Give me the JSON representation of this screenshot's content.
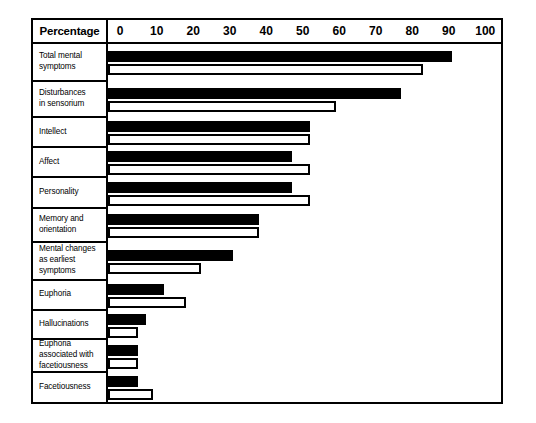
{
  "chart_data": {
    "type": "bar",
    "title": "",
    "xlabel": "Percentage",
    "ylabel": "",
    "xlim": [
      0,
      100
    ],
    "xticks": [
      0,
      10,
      20,
      30,
      40,
      50,
      60,
      70,
      80,
      90,
      100
    ],
    "grid": false,
    "orientation": "horizontal",
    "legend_position": "none",
    "categories": [
      "Total mental symptoms",
      "Disturbances in sensorium",
      "Intellect",
      "Affect",
      "Personality",
      "Memory and orientation",
      "Mental changes as earliest symptoms",
      "Euphoria",
      "Hallucinations",
      "Euphoria associated with facetiousness",
      "Facetiousness"
    ],
    "series": [
      {
        "name": "solid",
        "style": "filled-black",
        "values": [
          91,
          77,
          52,
          47,
          47,
          38,
          31,
          12,
          7,
          5,
          5
        ]
      },
      {
        "name": "open",
        "style": "outline-white",
        "values": [
          83,
          59,
          52,
          52,
          52,
          38,
          22,
          18,
          5,
          5,
          9
        ]
      }
    ]
  },
  "header": {
    "title": "Percentage",
    "ticks": [
      "0",
      "10",
      "20",
      "30",
      "40",
      "50",
      "60",
      "70",
      "80",
      "90",
      "100"
    ]
  },
  "rows": [
    {
      "label": "Total mental symptoms",
      "lines": [
        "Total mental",
        "symptoms"
      ]
    },
    {
      "label": "Disturbances in sensorium",
      "lines": [
        "Disturbances",
        "in sensorium"
      ]
    },
    {
      "label": "Intellect",
      "lines": [
        "Intellect"
      ]
    },
    {
      "label": "Affect",
      "lines": [
        "Affect"
      ]
    },
    {
      "label": "Personality",
      "lines": [
        "Personality"
      ]
    },
    {
      "label": "Memory and orientation",
      "lines": [
        "Memory and",
        "orientation"
      ]
    },
    {
      "label": "Mental changes as earliest symptoms",
      "lines": [
        "Mental changes",
        "as earliest",
        "symptoms"
      ]
    },
    {
      "label": "Euphoria",
      "lines": [
        "Euphoria"
      ]
    },
    {
      "label": "Hallucinations",
      "lines": [
        "Hallucinations"
      ]
    },
    {
      "label": "Euphoria associated with facetiousness",
      "lines": [
        "Euphoria",
        "associated with",
        "facetiousness"
      ]
    },
    {
      "label": "Facetiousness",
      "lines": [
        "Facetiousness"
      ]
    }
  ],
  "colors": {
    "ink": "#000000",
    "paper": "#ffffff",
    "bar_solid": "#000000",
    "bar_open_fill": "#ffffff"
  }
}
